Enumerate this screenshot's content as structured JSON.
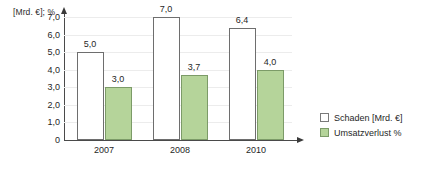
{
  "chart_data": {
    "type": "bar",
    "title": "",
    "subtitle": "",
    "xlabel": "",
    "ylabel": "[Mrd. €]; %",
    "categories": [
      "2007",
      "2008",
      "2010"
    ],
    "series": [
      {
        "name": "Schaden [Mrd. €]",
        "values": [
          5.0,
          7.0,
          6.4
        ],
        "labels": [
          "5,0",
          "7,0",
          "6,4"
        ],
        "color": "#ffffff",
        "border_color": "#6e6e6e"
      },
      {
        "name": "Umsatzverlust %",
        "values": [
          3.0,
          3.7,
          4.0
        ],
        "labels": [
          "3,0",
          "3,7",
          "4,0"
        ],
        "color": "#b5d49a",
        "border_color": "#7c9b68"
      }
    ],
    "ylim": [
      0,
      7.0
    ],
    "yticks": [
      0,
      1.0,
      2.0,
      3.0,
      4.0,
      5.0,
      6.0,
      7.0
    ],
    "ytick_labels": [
      "0",
      "1,0",
      "2,0",
      "3,0",
      "4,0",
      "5,0",
      "6,0",
      "7,0"
    ],
    "grid": true,
    "grid_color": "#ececec",
    "legend_position": "right",
    "decimal_separator": ","
  },
  "legend": {
    "items": [
      {
        "label": "Schaden [Mrd. €]",
        "swatch": "schaden"
      },
      {
        "label": "Umsatzverlust %",
        "swatch": "umsatz"
      }
    ]
  }
}
